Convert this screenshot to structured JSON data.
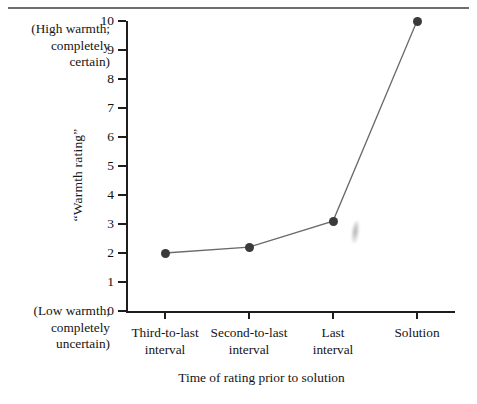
{
  "figure": {
    "background_color": "#ffffff",
    "ink_color": "#1a1a1a",
    "top_rule_color": "#6f6f6f",
    "annotation_high": "(High warmth;\ncompletely\ncertain)",
    "annotation_high_lines": [
      "(High warmth;",
      "completely",
      "certain)"
    ],
    "annotation_low_lines": [
      "(Low warmth;",
      "completely",
      "uncertain)"
    ],
    "artifact": "gray-smudge"
  },
  "chart_data": {
    "type": "line",
    "title": "",
    "xlabel": "Time of rating prior to solution",
    "ylabel": "“Warmth rating”",
    "categories": [
      "Third-to-last interval",
      "Second-to-last interval",
      "Last interval",
      "Solution"
    ],
    "category_lines": [
      [
        "Third-to-last",
        "interval"
      ],
      [
        "Second-to-last",
        "interval"
      ],
      [
        "Last",
        "interval"
      ],
      [
        "Solution",
        ""
      ]
    ],
    "values": [
      2.0,
      2.2,
      3.1,
      10.0
    ],
    "ylim": [
      0,
      10
    ],
    "yticks": [
      0,
      1,
      2,
      3,
      4,
      5,
      6,
      7,
      8,
      9,
      10
    ],
    "ytick_labels": [
      "0",
      "1",
      "2",
      "3",
      "4",
      "5",
      "6",
      "7",
      "8",
      "9",
      "10"
    ],
    "y_low_annotation": "(Low warmth; completely uncertain)",
    "y_high_annotation": "(High warmth; completely certain)",
    "grid": false,
    "legend": false,
    "marker": "filled-circle",
    "marker_color": "#3a3a3a",
    "line_color": "#6a6a6a"
  }
}
